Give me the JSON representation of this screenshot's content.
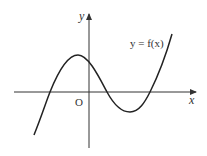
{
  "figure": {
    "type": "function graph",
    "function_label": "y = f(x)",
    "x_axis_label": "x",
    "y_axis_label": "y",
    "origin_label": "O",
    "curve_description": "cubic with positive leading coefficient; three real roots (one negative, two positive); local maximum at small negative x, local minimum at positive x",
    "colors": {
      "curve": "#222222",
      "axes": "#333333",
      "background": "#ffffff"
    }
  }
}
